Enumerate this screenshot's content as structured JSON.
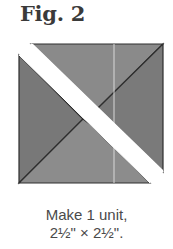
{
  "figure": {
    "title": "Fig. 2",
    "caption_line1": "Make 1 unit,",
    "caption_line2": "2½\" × 2½\".",
    "colors": {
      "fill_light": "#8a8a8a",
      "fill_dark": "#767676",
      "outline": "#2e2e2e",
      "band": "#ffffff",
      "seam_line": "#d8d8d8"
    }
  }
}
